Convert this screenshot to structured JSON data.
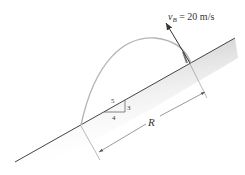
{
  "diagram": {
    "velocity_label": {
      "symbol": "v",
      "subscript": "B",
      "text": " = 20 m/s"
    },
    "slope_triangle": {
      "hypotenuse": "5",
      "vertical": "3",
      "horizontal": "4"
    },
    "range_label": "R",
    "colors": {
      "trajectory": "#b0b0b0",
      "ground_shade": "#c8c8c8",
      "line": "#444444"
    }
  }
}
